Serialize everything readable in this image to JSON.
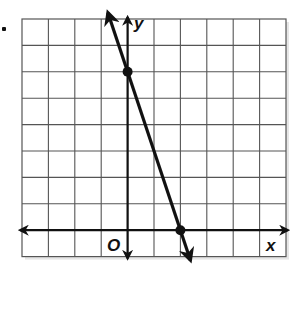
{
  "chart_data": {
    "type": "line",
    "title": "",
    "xlabel": "x",
    "ylabel": "y",
    "origin_label": "O",
    "grid": true,
    "grid_columns": 10,
    "grid_rows": 9,
    "x_range": [
      -4,
      6
    ],
    "y_range": [
      -1,
      8
    ],
    "tick_labels": [],
    "series": [
      {
        "name": "line",
        "equation": "y = -3x + 6",
        "points": [
          {
            "x": 0,
            "y": 6
          },
          {
            "x": 2,
            "y": 0
          }
        ],
        "direction": "arrows both ends"
      }
    ]
  },
  "labels": {
    "x_axis": "x",
    "y_axis": "y",
    "origin": "O"
  },
  "colors": {
    "grid": "#555555",
    "axis": "#111111",
    "line": "#111111",
    "background": "#ffffff"
  }
}
